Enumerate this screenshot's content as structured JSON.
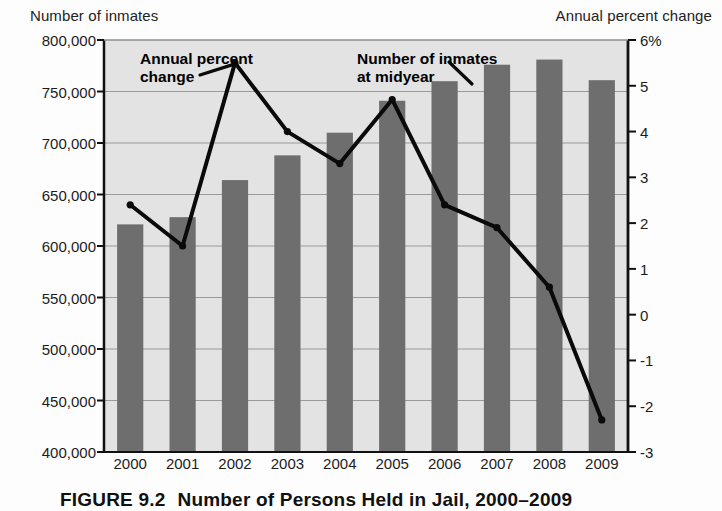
{
  "figure": {
    "caption_label": "FIGURE 9.2",
    "caption_text": "Number of Persons Held in Jail, 2000–2009"
  },
  "annotations": {
    "line_series": "Annual percent\nchange",
    "bar_series": "Number of inmates\nat midyear"
  },
  "colors": {
    "bar_fill": "#6e6e6e",
    "plot_background": "#e3e3e3",
    "gridline": "#9a9a9a",
    "line_stroke": "#0a0a0a",
    "axis": "#111111"
  },
  "chart_data": {
    "type": "bar",
    "title": "Number of Persons Held in Jail, 2000–2009",
    "xlabel": "",
    "ylabel": "Number of inmates",
    "y2label": "Annual percent change",
    "grid": true,
    "legend_position": "inline-annotations",
    "categories": [
      "2000",
      "2001",
      "2002",
      "2003",
      "2004",
      "2005",
      "2006",
      "2007",
      "2008",
      "2009"
    ],
    "ylim": [
      400000,
      800000
    ],
    "yticks": [
      400000,
      450000,
      500000,
      550000,
      600000,
      650000,
      700000,
      750000,
      800000
    ],
    "ytick_labels": [
      "400,000",
      "450,000",
      "500,000",
      "550,000",
      "600,000",
      "650,000",
      "700,000",
      "750,000",
      "800,000"
    ],
    "y2lim": [
      -3,
      6
    ],
    "y2ticks": [
      -3,
      -2,
      -1,
      0,
      1,
      2,
      3,
      4,
      5,
      6
    ],
    "y2tick_labels": [
      "-3",
      "-2",
      "-1",
      "0",
      "1",
      "2",
      "3",
      "4",
      "5",
      "6%"
    ],
    "series": [
      {
        "name": "Number of inmates at midyear",
        "type": "bar",
        "axis": "left",
        "values": [
          621000,
          628000,
          664000,
          688000,
          710000,
          741000,
          760000,
          776000,
          781000,
          761000
        ]
      },
      {
        "name": "Annual percent change",
        "type": "line",
        "axis": "right",
        "values": [
          2.4,
          1.5,
          5.5,
          4.0,
          3.3,
          4.7,
          2.4,
          1.9,
          0.6,
          -2.3
        ]
      }
    ]
  }
}
